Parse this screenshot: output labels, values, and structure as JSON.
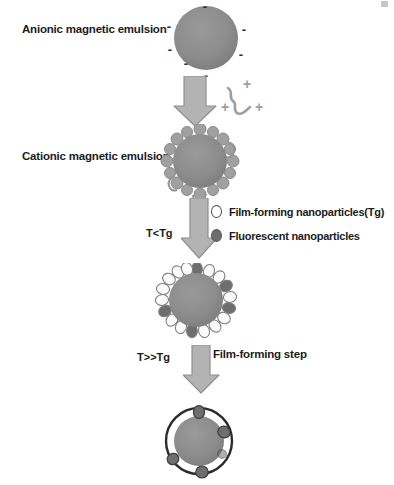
{
  "figure": {
    "background_color": "#ffffff"
  },
  "labels": {
    "anionic": "Anionic magnetic emulsion",
    "cationic": "Cationic magnetic emulsion",
    "film_forming_step": "Film-forming step"
  },
  "conditions": {
    "below_tg": "T<Tg",
    "above_tg": "T>>Tg"
  },
  "legend": {
    "items": [
      {
        "label": "Film-forming nanoparticles(Tg)",
        "marker": "hollow-circle-icon",
        "color": "#ffffff"
      },
      {
        "label": "Fluorescent nanoparticles",
        "marker": "filled-circle-icon",
        "color": "#6e6e6e"
      }
    ]
  },
  "charges": {
    "negative_symbol": "-",
    "negative_count": 7,
    "positive_symbol": "+",
    "positive_count": 3
  },
  "colors": {
    "core_gray": "#8c8c8c",
    "core_gray_dark": "#7d7d7d",
    "arrow_fill": "#b3b3b3",
    "arrow_stroke": "#8f8f8f",
    "corona_gray": "#9a9a9a",
    "nanoparticle_white": "#fbfbfb",
    "nanoparticle_dark": "#6e6e6e",
    "film_outline": "#2b2b2b",
    "text": "#1c1c1c"
  },
  "structures": {
    "anionic_emulsion": {
      "type": "plain-sphere",
      "core_diameter": 64
    },
    "polymer_chain": {
      "type": "cationic-polymer-chain",
      "charges": 3
    },
    "cationic_emulsion": {
      "type": "corona-sphere",
      "core_diameter": 52
    },
    "nanoparticle_shell": {
      "type": "beaded-shell-sphere",
      "core_diameter": 56,
      "bead_count": 18,
      "dark_bead_indices": [
        0,
        3,
        5,
        11,
        14
      ]
    },
    "final_film": {
      "type": "film-encapsulated-sphere",
      "outer_diameter": 66,
      "core_diameter": 48,
      "embedded_particle_count": 5
    }
  },
  "steps": [
    {
      "index": 1,
      "name": "anionic-emulsion"
    },
    {
      "index": 2,
      "name": "cationic-adsorption"
    },
    {
      "index": 3,
      "name": "cationic-emulsion"
    },
    {
      "index": 4,
      "name": "nanoparticle-adsorption-below-tg"
    },
    {
      "index": 5,
      "name": "nanoparticle-shelled-emulsion"
    },
    {
      "index": 6,
      "name": "film-forming-above-tg"
    },
    {
      "index": 7,
      "name": "final-film-encapsulated-particle"
    }
  ]
}
